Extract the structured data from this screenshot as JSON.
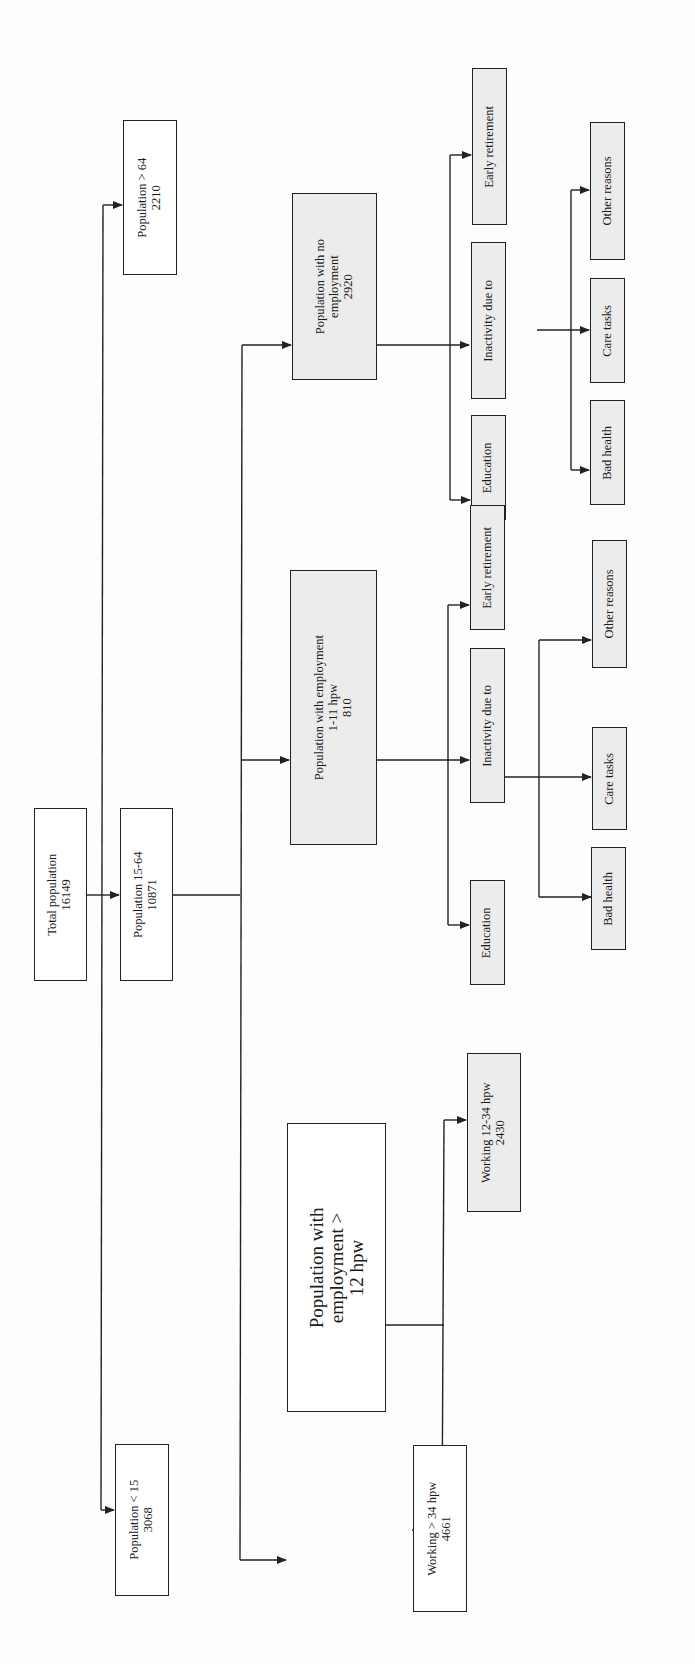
{
  "diagram": {
    "title": "",
    "orientation": "rotated 90deg counter-clockwise (text reads bottom-to-top)",
    "nodes": {
      "total_population": {
        "label": "Total population",
        "value": "16149"
      },
      "pop_over_64": {
        "label": "Population > 64",
        "value": "2210"
      },
      "pop_15_64": {
        "label": "Population 15-64",
        "value": "10871"
      },
      "pop_under_15": {
        "label": "Population < 15",
        "value": "3068"
      },
      "pop_no_employment": {
        "label_line1": "Population with no",
        "label_line2": "employment",
        "value": "2920"
      },
      "pop_emp_1_11": {
        "label_line1": "Population with employment",
        "label_line2": "1-11 hpw",
        "value": "810"
      },
      "pop_emp_over_12": {
        "label_line1": "Population with",
        "label_line2": "employment >",
        "label_line3": "12 hpw"
      },
      "working_12_34": {
        "label": "Working 12-34 hpw",
        "value": "2430"
      },
      "working_over_34": {
        "label": "Working > 34 hpw",
        "value": "4661"
      },
      "ne_early_retirement": {
        "label": "Early retirement"
      },
      "ne_inactivity": {
        "label": "Inactivity due to"
      },
      "ne_education": {
        "label": "Education"
      },
      "ne_other_reasons": {
        "label": "Other reasons"
      },
      "ne_care_tasks": {
        "label": "Care tasks"
      },
      "ne_bad_health": {
        "label": "Bad health"
      },
      "e111_early_retirement": {
        "label": "Early retirement"
      },
      "e111_inactivity": {
        "label": "Inactivity due to"
      },
      "e111_education": {
        "label": "Education"
      },
      "e111_other_reasons": {
        "label": "Other reasons"
      },
      "e111_care_tasks": {
        "label": "Care tasks"
      },
      "e111_bad_health": {
        "label": "Bad health"
      }
    },
    "edges": [
      [
        "total_population",
        "pop_15_64"
      ],
      [
        "total_population",
        "pop_over_64"
      ],
      [
        "total_population",
        "pop_under_15"
      ],
      [
        "pop_15_64",
        "pop_no_employment"
      ],
      [
        "pop_15_64",
        "pop_emp_1_11"
      ],
      [
        "pop_15_64",
        "pop_emp_over_12"
      ],
      [
        "pop_no_employment",
        "ne_early_retirement"
      ],
      [
        "pop_no_employment",
        "ne_inactivity"
      ],
      [
        "pop_no_employment",
        "ne_education"
      ],
      [
        "ne_inactivity",
        "ne_other_reasons"
      ],
      [
        "ne_inactivity",
        "ne_care_tasks"
      ],
      [
        "ne_inactivity",
        "ne_bad_health"
      ],
      [
        "pop_emp_1_11",
        "e111_early_retirement"
      ],
      [
        "pop_emp_1_11",
        "e111_inactivity"
      ],
      [
        "pop_emp_1_11",
        "e111_education"
      ],
      [
        "e111_inactivity",
        "e111_other_reasons"
      ],
      [
        "e111_inactivity",
        "e111_care_tasks"
      ],
      [
        "e111_inactivity",
        "e111_bad_health"
      ],
      [
        "pop_emp_over_12",
        "working_12_34"
      ],
      [
        "pop_emp_over_12",
        "working_over_34"
      ]
    ],
    "colors": {
      "line": "#222222",
      "shaded_fill": "#ececec",
      "plain_fill": "#ffffff"
    }
  }
}
